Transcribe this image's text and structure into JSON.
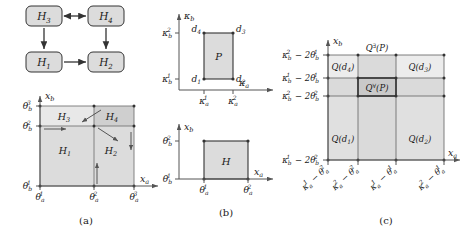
{
  "figure": {
    "caption_labels": {
      "a": "(a)",
      "b": "(b)",
      "c": "(c)"
    }
  },
  "panel_a": {
    "graph": {
      "nodes": [
        {
          "id": "H3",
          "label": "H",
          "sub": "3",
          "x": 44,
          "y": 16
        },
        {
          "id": "H4",
          "label": "H",
          "sub": "4",
          "x": 106,
          "y": 16
        },
        {
          "id": "H1",
          "label": "H",
          "sub": "1",
          "x": 44,
          "y": 62
        },
        {
          "id": "H2",
          "label": "H",
          "sub": "2",
          "x": 106,
          "y": 62
        }
      ],
      "edges": [
        {
          "from": "H3",
          "to": "H4",
          "type": "bidirectional"
        },
        {
          "from": "H3",
          "to": "H1",
          "type": "directed"
        },
        {
          "from": "H4",
          "to": "H2",
          "type": "directed"
        },
        {
          "from": "H1",
          "to": "H2",
          "type": "directed"
        }
      ]
    },
    "axes": {
      "x_label": "x",
      "x_sub": "a",
      "y_label": "x",
      "y_sub": "b",
      "x_ticks": [
        {
          "base": "θ",
          "sub": "a",
          "sup": "1"
        },
        {
          "base": "θ",
          "sub": "a",
          "sup": "2"
        },
        {
          "base": "θ",
          "sub": "a",
          "sup": "3"
        }
      ],
      "y_ticks": [
        {
          "base": "θ",
          "sub": "b",
          "sup": "1"
        },
        {
          "base": "θ",
          "sub": "b",
          "sup": "2"
        },
        {
          "base": "θ",
          "sub": "b",
          "sup": "3"
        }
      ]
    },
    "regions": [
      {
        "id": "H1",
        "label": "H",
        "sub": "1"
      },
      {
        "id": "H2",
        "label": "H",
        "sub": "2"
      },
      {
        "id": "H3",
        "label": "H",
        "sub": "3"
      },
      {
        "id": "H4",
        "label": "H",
        "sub": "4"
      }
    ]
  },
  "panel_b_top": {
    "axes": {
      "x_label": "κ",
      "x_sub": "a",
      "y_label": "κ",
      "y_sub": "b",
      "x_ticks": [
        {
          "base": "κ",
          "sub": "a",
          "sup": "1"
        },
        {
          "base": "κ",
          "sub": "a",
          "sup": "2"
        }
      ],
      "y_ticks": [
        {
          "base": "κ",
          "sub": "b",
          "sup": "1"
        },
        {
          "base": "κ",
          "sub": "b",
          "sup": "2"
        }
      ]
    },
    "region_label": "P",
    "corners": [
      {
        "id": "d1",
        "base": "d",
        "sub": "1"
      },
      {
        "id": "d2",
        "base": "d",
        "sub": "2"
      },
      {
        "id": "d3",
        "base": "d",
        "sub": "3"
      },
      {
        "id": "d4",
        "base": "d",
        "sub": "4"
      }
    ]
  },
  "panel_b_bottom": {
    "axes": {
      "x_label": "x",
      "x_sub": "a",
      "y_label": "x",
      "y_sub": "b",
      "x_ticks": [
        {
          "base": "θ",
          "sub": "a",
          "sup": "1"
        },
        {
          "base": "θ",
          "sub": "a",
          "sup": "2"
        }
      ],
      "y_ticks": [
        {
          "base": "θ",
          "sub": "b",
          "sup": "1"
        },
        {
          "base": "θ",
          "sub": "b",
          "sup": "2"
        }
      ]
    },
    "region_label": "H"
  },
  "panel_c": {
    "axes": {
      "x_label": "x",
      "x_sub": "a",
      "y_label": "x",
      "y_sub": "b",
      "x_ticks": [
        "κₐ¹ − θₐ²",
        "κₐ² − θₐ²",
        "κₐ¹ − θₐ¹",
        "κₐ² − θₐ¹"
      ],
      "y_ticks": [
        "κ_b^2 − 2θ_b^1",
        "κ_b^1 − 2θ_b^1",
        "κ_b^2 − 2θ_b^2",
        "κ_b^1 − 2θ_b^2"
      ]
    },
    "top_label": {
      "base": "Q",
      "sup": "∃",
      "arg": "(P)"
    },
    "center_label": {
      "base": "Q",
      "sup": "∀",
      "arg": "(P)"
    },
    "cells": [
      {
        "id": "Qd4",
        "base": "Q",
        "arg": "(d₄)"
      },
      {
        "id": "Qd3",
        "base": "Q",
        "arg": "(d₃)"
      },
      {
        "id": "Qd1",
        "base": "Q",
        "arg": "(d₁)"
      },
      {
        "id": "Qd2",
        "base": "Q",
        "arg": "(d₂)"
      }
    ]
  },
  "colors": {
    "fill_light": "#e2e2e2",
    "fill_mid": "#d2d2d2",
    "fill_dark": "#c4c4c4",
    "node_fill": "#dcdcdc",
    "stroke": "#333333",
    "axis": "#555555",
    "text": "#1a1a1a"
  }
}
